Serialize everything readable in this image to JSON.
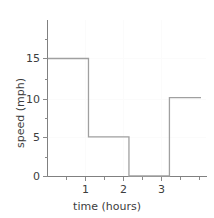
{
  "chart_data": {
    "type": "line",
    "subtype": "step",
    "title": "",
    "xlabel": "time (hours)",
    "ylabel": "speed (mph)",
    "xlim": [
      0,
      3.78
    ],
    "ylim": [
      0,
      17.5
    ],
    "xticks": [
      0,
      1,
      2,
      3
    ],
    "xticklabels": [
      "",
      "1",
      "2",
      "3"
    ],
    "yticks": [
      0,
      5,
      10,
      15
    ],
    "yticklabels": [
      "0",
      "5",
      "10",
      "15"
    ],
    "x_minor_ticks": [
      0.5,
      1.5,
      2.5,
      3.5
    ],
    "y_minor_ticks": [
      2.5,
      7.5,
      12.5,
      17.5
    ],
    "grid": false,
    "legend": "none",
    "x": [
      0,
      1,
      1,
      2,
      2,
      3,
      3,
      3.78
    ],
    "y": [
      15,
      15,
      5,
      5,
      0,
      0,
      10,
      10
    ],
    "segments": [
      {
        "x_start": 0,
        "x_end": 1,
        "value": 15
      },
      {
        "x_start": 1,
        "x_end": 2,
        "value": 5
      },
      {
        "x_start": 2,
        "x_end": 3,
        "value": 0
      },
      {
        "x_start": 3,
        "x_end": 3.78,
        "value": 10
      }
    ],
    "line_color": "#a0a0a0",
    "axis_color": "#808080",
    "text_color": "#3d3d3d",
    "background": "#ffffff"
  },
  "axes": {
    "x_title": "time (hours)",
    "y_title": "speed (mph)",
    "y_labels": {
      "t0": "0",
      "t5": "5",
      "t10": "10",
      "t15": "15"
    },
    "x_labels": {
      "t1": "1",
      "t2": "2",
      "t3": "3"
    }
  }
}
